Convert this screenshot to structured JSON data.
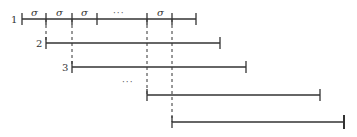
{
  "diagram": {
    "rows": [
      {
        "label": "1",
        "y": 19,
        "x1": 22,
        "x2": 196
      },
      {
        "label": "2",
        "y": 43,
        "x1": 46,
        "x2": 220
      },
      {
        "label": "3",
        "y": 67,
        "x1": 72,
        "x2": 246
      },
      {
        "label": "",
        "y": 95,
        "x1": 147,
        "x2": 320
      },
      {
        "label": "",
        "y": 122,
        "x1": 172,
        "x2": 344
      }
    ],
    "row1_ticks": [
      46,
      72,
      97,
      147,
      172
    ],
    "segment_labels": [
      {
        "text": "σ",
        "x": 34
      },
      {
        "text": "σ",
        "x": 59
      },
      {
        "text": "σ",
        "x": 84
      },
      {
        "text": "···",
        "x": 122
      },
      {
        "text": "σ",
        "x": 160
      }
    ],
    "dashed_verticals": [
      46,
      72,
      147,
      172
    ],
    "ellipsis_row": {
      "text": "···",
      "x": 130,
      "y": 84
    },
    "stroke_color": "#333333"
  }
}
